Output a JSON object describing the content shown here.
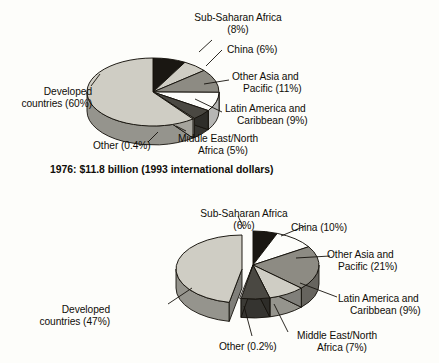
{
  "figure": {
    "background_color": "#fdfdfa",
    "text_color": "#100d08"
  },
  "chart_data": [
    {
      "type": "pie",
      "title": "1976: $11.8 billion (1993 international dollars)",
      "caption": "1976: $11.8 billion (1993 international dollars)",
      "legend": "none",
      "grid": false,
      "exploded": false,
      "three_d": true,
      "categories": [
        "Sub-Saharan Africa",
        "China",
        "Other Asia and Pacific",
        "Latin America and Caribbean",
        "Middle East/North Africa",
        "Other",
        "Developed countries"
      ],
      "values": [
        8,
        6,
        11,
        9,
        5,
        0.4,
        60
      ],
      "value_unit": "percent",
      "slice_colors": [
        "#1a1712",
        "#cfcdc4",
        "#8d8b83",
        "#fdfdfa",
        "#4a4842",
        "#cfcdc4",
        "#cfcdc4"
      ],
      "labels": [
        {
          "text": "Sub-Saharan Africa",
          "value_text": "(8%)"
        },
        {
          "text": "China (6%)"
        },
        {
          "text": "Other Asia and",
          "value_text": "Pacific (11%)"
        },
        {
          "text": "Latin America and",
          "value_text": "Caribbean (9%)"
        },
        {
          "text": "Middle East/North",
          "value_text": "Africa (5%)"
        },
        {
          "text": "Other (0.4%)"
        },
        {
          "text": "Developed",
          "value_text": "countries (60%)"
        }
      ]
    },
    {
      "type": "pie",
      "title": "",
      "caption": "",
      "legend": "none",
      "grid": false,
      "exploded": true,
      "exploded_slice": "Developed countries",
      "three_d": true,
      "cropped_bottom": true,
      "categories": [
        "Sub-Saharan Africa",
        "China",
        "Other Asia and Pacific",
        "Latin America and Caribbean",
        "Middle East/North Africa",
        "Other",
        "Developed countries"
      ],
      "values": [
        6,
        10,
        21,
        9,
        7,
        0.2,
        47
      ],
      "value_unit": "percent",
      "slice_colors": [
        "#1a1712",
        "#fdfdfa",
        "#8d8b83",
        "#cfcdc4",
        "#4a4842",
        "#fdfdfa",
        "#cfcdc4"
      ],
      "labels": [
        {
          "text": "Sub-Saharan Africa",
          "value_text": "(6%)"
        },
        {
          "text": "China (10%)"
        },
        {
          "text": "Other Asia and",
          "value_text": "Pacific (21%)"
        },
        {
          "text": "Latin America and",
          "value_text": "Caribbean (9%)"
        },
        {
          "text": "Middle East/North",
          "value_text": "Africa (7%)"
        },
        {
          "text": "Other (0.2%)"
        },
        {
          "text": "Developed",
          "value_text": "countries (47%)"
        }
      ]
    }
  ],
  "chart_top": {
    "caption": "1976: $11.8 billion (1993 international dollars)",
    "labels": {
      "ssa_l1": "Sub-Saharan Africa",
      "ssa_l2": "(8%)",
      "china": "China (6%)",
      "oap_l1": "Other Asia and",
      "oap_l2": "Pacific (11%)",
      "lac_l1": "Latin America and",
      "lac_l2": "Caribbean (9%)",
      "mena_l1": "Middle East/North",
      "mena_l2": "Africa (5%)",
      "other": "Other (0.4%)",
      "dev_l1": "Developed",
      "dev_l2": "countries (60%)"
    }
  },
  "chart_bottom": {
    "caption": "",
    "labels": {
      "ssa_l1": "Sub-Saharan Africa",
      "ssa_l2": "(6%)",
      "china": "China (10%)",
      "oap_l1": "Other Asia and",
      "oap_l2": "Pacific (21%)",
      "lac_l1": "Latin America and",
      "lac_l2": "Caribbean (9%)",
      "mena_l1": "Middle East/North",
      "mena_l2": "Africa (7%)",
      "other": "Other (0.2%)",
      "dev_l1": "Developed",
      "dev_l2": "countries (47%)"
    }
  }
}
